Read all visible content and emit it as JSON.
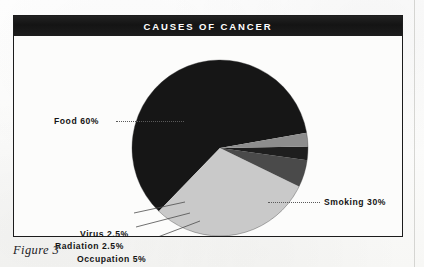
{
  "figure": {
    "title": "CAUSES OF CANCER",
    "caption": "Figure 3"
  },
  "chart_data": {
    "type": "pie",
    "title": "CAUSES OF CANCER",
    "categories": [
      "Food",
      "Smoking",
      "Occupation",
      "Radiation",
      "Virus"
    ],
    "values": [
      60,
      30,
      5,
      2.5,
      2.5
    ],
    "value_unit": "%",
    "labels": [
      "Food 60%",
      "Smoking 30%",
      "Occupation 5%",
      "Radiation 2.5%",
      "Virus 2.5%"
    ],
    "slice_colors": [
      "#161616",
      "#c9c9c9",
      "#4a4a4a",
      "#1e1e1e",
      "#8d8d8d"
    ],
    "legend": "none",
    "grid": false,
    "annotations": [
      "Food 60%",
      "Smoking 30%",
      "Virus 2.5%",
      "Radiation 2.5%",
      "Occupation 5%"
    ]
  },
  "labels": {
    "food": "Food 60%",
    "smoking": "Smoking 30%",
    "virus": "Virus 2.5%",
    "radiation": "Radiation 2.5%",
    "occupation": "Occupation 5%"
  },
  "colors": {
    "title_band": "#181818",
    "title_text": "#ffffff",
    "food_slice": "#161616",
    "smoking_slice": "#c9c9c9",
    "occupation_slice": "#4a4a4a",
    "radiation_slice": "#1e1e1e",
    "virus_slice": "#8d8d8d",
    "frame": "#1c1c1c",
    "paper": "#fdfdfc"
  }
}
